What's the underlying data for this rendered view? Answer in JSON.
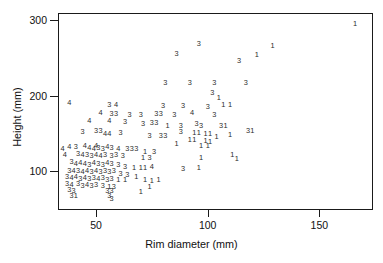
{
  "chart_data": {
    "type": "scatter",
    "title": "",
    "xlabel": "Rim diameter (mm)",
    "ylabel": "Height (mm)",
    "xlim": [
      33,
      174
    ],
    "ylim": [
      49,
      309
    ],
    "xticks": [
      50,
      100,
      150
    ],
    "xtick_labels": [
      "50",
      "100",
      "150"
    ],
    "yticks": [
      100,
      200,
      300
    ],
    "ytick_labels": [
      "100",
      "200",
      "300"
    ],
    "grid": false,
    "legend": "none",
    "marker_style": "group-number-glyph",
    "groups": [
      "1",
      "3",
      "4"
    ],
    "note": "Each plotted point is drawn as its cluster/group number (1, 3 or 4) instead of a symbol.",
    "points": [
      {
        "x": 166,
        "y": 294,
        "label": "1"
      },
      {
        "x": 96,
        "y": 268,
        "label": "3"
      },
      {
        "x": 129,
        "y": 266,
        "label": "1"
      },
      {
        "x": 86,
        "y": 255,
        "label": "3"
      },
      {
        "x": 122,
        "y": 254,
        "label": "1"
      },
      {
        "x": 114,
        "y": 245,
        "label": "3"
      },
      {
        "x": 81,
        "y": 216,
        "label": "3"
      },
      {
        "x": 92,
        "y": 216,
        "label": "3"
      },
      {
        "x": 103,
        "y": 216,
        "label": "3"
      },
      {
        "x": 117,
        "y": 216,
        "label": "3"
      },
      {
        "x": 102,
        "y": 203,
        "label": "3"
      },
      {
        "x": 105,
        "y": 197,
        "label": "1"
      },
      {
        "x": 107,
        "y": 187,
        "label": "1"
      },
      {
        "x": 110,
        "y": 187,
        "label": "1"
      },
      {
        "x": 38,
        "y": 190,
        "label": "4"
      },
      {
        "x": 56,
        "y": 188,
        "label": "3"
      },
      {
        "x": 59,
        "y": 188,
        "label": "4"
      },
      {
        "x": 80,
        "y": 186,
        "label": "3"
      },
      {
        "x": 89,
        "y": 186,
        "label": "3"
      },
      {
        "x": 100,
        "y": 185,
        "label": "3"
      },
      {
        "x": 52,
        "y": 177,
        "label": "4"
      },
      {
        "x": 57,
        "y": 176,
        "label": "3"
      },
      {
        "x": 59,
        "y": 176,
        "label": "3"
      },
      {
        "x": 65,
        "y": 175,
        "label": "3"
      },
      {
        "x": 70,
        "y": 175,
        "label": "3"
      },
      {
        "x": 77,
        "y": 176,
        "label": "3"
      },
      {
        "x": 79,
        "y": 176,
        "label": "3"
      },
      {
        "x": 85,
        "y": 175,
        "label": "3"
      },
      {
        "x": 93,
        "y": 177,
        "label": "4"
      },
      {
        "x": 103,
        "y": 174,
        "label": "3"
      },
      {
        "x": 47,
        "y": 167,
        "label": "4"
      },
      {
        "x": 56,
        "y": 166,
        "label": "4"
      },
      {
        "x": 63,
        "y": 165,
        "label": "3"
      },
      {
        "x": 71,
        "y": 163,
        "label": "3"
      },
      {
        "x": 75,
        "y": 164,
        "label": "3"
      },
      {
        "x": 77,
        "y": 164,
        "label": "3"
      },
      {
        "x": 82,
        "y": 160,
        "label": "1"
      },
      {
        "x": 88,
        "y": 160,
        "label": "3"
      },
      {
        "x": 95,
        "y": 162,
        "label": "3"
      },
      {
        "x": 97,
        "y": 160,
        "label": "3"
      },
      {
        "x": 106,
        "y": 160,
        "label": "3"
      },
      {
        "x": 108,
        "y": 160,
        "label": "1"
      },
      {
        "x": 118,
        "y": 153,
        "label": "3"
      },
      {
        "x": 120,
        "y": 153,
        "label": "1"
      },
      {
        "x": 44,
        "y": 152,
        "label": "3"
      },
      {
        "x": 50,
        "y": 153,
        "label": "3"
      },
      {
        "x": 52,
        "y": 153,
        "label": "3"
      },
      {
        "x": 54,
        "y": 149,
        "label": "4"
      },
      {
        "x": 56,
        "y": 149,
        "label": "4"
      },
      {
        "x": 61,
        "y": 150,
        "label": "3"
      },
      {
        "x": 74,
        "y": 147,
        "label": "3"
      },
      {
        "x": 79,
        "y": 147,
        "label": "3"
      },
      {
        "x": 81,
        "y": 147,
        "label": "3"
      },
      {
        "x": 88,
        "y": 152,
        "label": "3"
      },
      {
        "x": 94,
        "y": 150,
        "label": "1"
      },
      {
        "x": 96,
        "y": 150,
        "label": "1"
      },
      {
        "x": 99,
        "y": 149,
        "label": "1"
      },
      {
        "x": 101,
        "y": 149,
        "label": "1"
      },
      {
        "x": 104,
        "y": 146,
        "label": "1"
      },
      {
        "x": 110,
        "y": 148,
        "label": "1"
      },
      {
        "x": 92,
        "y": 141,
        "label": "1"
      },
      {
        "x": 94,
        "y": 141,
        "label": "1"
      },
      {
        "x": 99,
        "y": 140,
        "label": "1"
      },
      {
        "x": 101,
        "y": 139,
        "label": "1"
      },
      {
        "x": 86,
        "y": 136,
        "label": "1"
      },
      {
        "x": 97,
        "y": 133,
        "label": "1"
      },
      {
        "x": 100,
        "y": 134,
        "label": "1"
      },
      {
        "x": 111,
        "y": 122,
        "label": "1"
      },
      {
        "x": 113,
        "y": 116,
        "label": "1"
      },
      {
        "x": 97,
        "y": 117,
        "label": "1"
      },
      {
        "x": 96,
        "y": 105,
        "label": "1"
      },
      {
        "x": 89,
        "y": 103,
        "label": "3"
      },
      {
        "x": 35,
        "y": 130,
        "label": "4"
      },
      {
        "x": 38,
        "y": 132,
        "label": "4"
      },
      {
        "x": 41,
        "y": 132,
        "label": "3"
      },
      {
        "x": 45,
        "y": 133,
        "label": "4"
      },
      {
        "x": 47,
        "y": 131,
        "label": "4"
      },
      {
        "x": 49,
        "y": 130,
        "label": "4"
      },
      {
        "x": 50,
        "y": 134,
        "label": "4"
      },
      {
        "x": 51,
        "y": 131,
        "label": "3"
      },
      {
        "x": 53,
        "y": 130,
        "label": "3"
      },
      {
        "x": 55,
        "y": 132,
        "label": "4"
      },
      {
        "x": 57,
        "y": 131,
        "label": "3"
      },
      {
        "x": 60,
        "y": 130,
        "label": "4"
      },
      {
        "x": 64,
        "y": 129,
        "label": "3"
      },
      {
        "x": 66,
        "y": 129,
        "label": "3"
      },
      {
        "x": 68,
        "y": 129,
        "label": "3"
      },
      {
        "x": 72,
        "y": 126,
        "label": "1"
      },
      {
        "x": 76,
        "y": 125,
        "label": "3"
      },
      {
        "x": 36,
        "y": 122,
        "label": "4"
      },
      {
        "x": 42,
        "y": 123,
        "label": "3"
      },
      {
        "x": 44,
        "y": 121,
        "label": "4"
      },
      {
        "x": 46,
        "y": 122,
        "label": "3"
      },
      {
        "x": 48,
        "y": 120,
        "label": "3"
      },
      {
        "x": 50,
        "y": 121,
        "label": "4"
      },
      {
        "x": 52,
        "y": 120,
        "label": "4"
      },
      {
        "x": 54,
        "y": 122,
        "label": "3"
      },
      {
        "x": 57,
        "y": 120,
        "label": "3"
      },
      {
        "x": 59,
        "y": 122,
        "label": "3"
      },
      {
        "x": 62,
        "y": 120,
        "label": "3"
      },
      {
        "x": 71,
        "y": 118,
        "label": "1"
      },
      {
        "x": 74,
        "y": 117,
        "label": "3"
      },
      {
        "x": 39,
        "y": 112,
        "label": "3"
      },
      {
        "x": 41,
        "y": 110,
        "label": "4"
      },
      {
        "x": 43,
        "y": 111,
        "label": "4"
      },
      {
        "x": 45,
        "y": 110,
        "label": "4"
      },
      {
        "x": 47,
        "y": 109,
        "label": "3"
      },
      {
        "x": 49,
        "y": 111,
        "label": "4"
      },
      {
        "x": 51,
        "y": 110,
        "label": "3"
      },
      {
        "x": 53,
        "y": 109,
        "label": "3"
      },
      {
        "x": 55,
        "y": 111,
        "label": "4"
      },
      {
        "x": 57,
        "y": 110,
        "label": "3"
      },
      {
        "x": 60,
        "y": 109,
        "label": "3"
      },
      {
        "x": 63,
        "y": 106,
        "label": "3"
      },
      {
        "x": 67,
        "y": 104,
        "label": "1"
      },
      {
        "x": 70,
        "y": 104,
        "label": "1"
      },
      {
        "x": 72,
        "y": 105,
        "label": "1"
      },
      {
        "x": 75,
        "y": 106,
        "label": "4"
      },
      {
        "x": 38,
        "y": 101,
        "label": "3"
      },
      {
        "x": 40,
        "y": 100,
        "label": "4"
      },
      {
        "x": 42,
        "y": 101,
        "label": "3"
      },
      {
        "x": 44,
        "y": 99,
        "label": "4"
      },
      {
        "x": 46,
        "y": 100,
        "label": "4"
      },
      {
        "x": 48,
        "y": 99,
        "label": "3"
      },
      {
        "x": 50,
        "y": 100,
        "label": "4"
      },
      {
        "x": 52,
        "y": 99,
        "label": "3"
      },
      {
        "x": 54,
        "y": 100,
        "label": "3"
      },
      {
        "x": 56,
        "y": 99,
        "label": "3"
      },
      {
        "x": 58,
        "y": 100,
        "label": "3"
      },
      {
        "x": 61,
        "y": 97,
        "label": "3"
      },
      {
        "x": 64,
        "y": 95,
        "label": "3"
      },
      {
        "x": 68,
        "y": 93,
        "label": "1"
      },
      {
        "x": 37,
        "y": 92,
        "label": "3"
      },
      {
        "x": 39,
        "y": 91,
        "label": "4"
      },
      {
        "x": 41,
        "y": 92,
        "label": "4"
      },
      {
        "x": 43,
        "y": 90,
        "label": "3"
      },
      {
        "x": 45,
        "y": 91,
        "label": "4"
      },
      {
        "x": 47,
        "y": 90,
        "label": "3"
      },
      {
        "x": 49,
        "y": 91,
        "label": "3"
      },
      {
        "x": 51,
        "y": 90,
        "label": "4"
      },
      {
        "x": 53,
        "y": 91,
        "label": "3"
      },
      {
        "x": 55,
        "y": 89,
        "label": "3"
      },
      {
        "x": 57,
        "y": 90,
        "label": "3"
      },
      {
        "x": 60,
        "y": 88,
        "label": "1"
      },
      {
        "x": 63,
        "y": 88,
        "label": "1"
      },
      {
        "x": 72,
        "y": 88,
        "label": "1"
      },
      {
        "x": 75,
        "y": 87,
        "label": "1"
      },
      {
        "x": 78,
        "y": 88,
        "label": "1"
      },
      {
        "x": 37,
        "y": 83,
        "label": "3"
      },
      {
        "x": 39,
        "y": 82,
        "label": "4"
      },
      {
        "x": 42,
        "y": 83,
        "label": "3"
      },
      {
        "x": 44,
        "y": 81,
        "label": "3"
      },
      {
        "x": 46,
        "y": 82,
        "label": "4"
      },
      {
        "x": 48,
        "y": 81,
        "label": "3"
      },
      {
        "x": 50,
        "y": 82,
        "label": "3"
      },
      {
        "x": 53,
        "y": 81,
        "label": "3"
      },
      {
        "x": 56,
        "y": 80,
        "label": "1"
      },
      {
        "x": 58,
        "y": 79,
        "label": "3"
      },
      {
        "x": 74,
        "y": 80,
        "label": "1"
      },
      {
        "x": 38,
        "y": 75,
        "label": "3"
      },
      {
        "x": 40,
        "y": 74,
        "label": "3"
      },
      {
        "x": 55,
        "y": 74,
        "label": "3"
      },
      {
        "x": 57,
        "y": 74,
        "label": "3"
      },
      {
        "x": 70,
        "y": 73,
        "label": "1"
      },
      {
        "x": 39,
        "y": 68,
        "label": "3"
      },
      {
        "x": 41,
        "y": 68,
        "label": "1"
      },
      {
        "x": 56,
        "y": 67,
        "label": "3"
      },
      {
        "x": 57,
        "y": 64,
        "label": "3"
      }
    ]
  }
}
